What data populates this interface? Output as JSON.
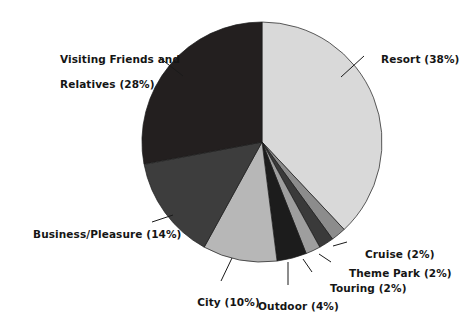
{
  "chart_data": {
    "type": "pie",
    "title": "",
    "subtitle": "",
    "xlabel": "",
    "ylabel": "",
    "legend_position": "none",
    "grid": false,
    "start_angle_deg": 0,
    "direction": "clockwise",
    "unit": "%",
    "categories": [
      "Resort",
      "Cruise",
      "Theme Park",
      "Touring",
      "Outdoor",
      "City",
      "Business/Pleasure",
      "Visiting Friends and Relatives"
    ],
    "values": [
      38,
      2,
      2,
      2,
      4,
      10,
      14,
      28
    ],
    "slices": [
      {
        "name": "Resort",
        "value": 38,
        "label": "Resort (38%)",
        "label_lines": [
          "Resort (38%)"
        ],
        "color": "#d9d9d9"
      },
      {
        "name": "Cruise",
        "value": 2,
        "label": "Cruise (2%)",
        "label_lines": [
          "Cruise (2%)"
        ],
        "color": "#8c8c8c"
      },
      {
        "name": "Theme Park",
        "value": 2,
        "label": "Theme Park (2%)",
        "label_lines": [
          "Theme Park (2%)"
        ],
        "color": "#3a3a3a"
      },
      {
        "name": "Touring",
        "value": 2,
        "label": "Touring (2%)",
        "label_lines": [
          "Touring (2%)"
        ],
        "color": "#9e9e9e"
      },
      {
        "name": "Outdoor",
        "value": 4,
        "label": "Outdoor (4%)",
        "label_lines": [
          "Outdoor (4%)"
        ],
        "color": "#1c1c1c"
      },
      {
        "name": "City",
        "value": 10,
        "label": "City (10%)",
        "label_lines": [
          "City (10%)"
        ],
        "color": "#b7b7b7"
      },
      {
        "name": "Business/Pleasure",
        "value": 14,
        "label": "Business/Pleasure (14%)",
        "label_lines": [
          "Business/Pleasure (14%)"
        ],
        "color": "#3d3d3d"
      },
      {
        "name": "Visiting Friends and Relatives",
        "value": 28,
        "label": "Visiting Friends and Relatives (28%)",
        "label_lines": [
          "Visiting Friends and",
          "Relatives (28%)"
        ],
        "color": "#231f1f"
      }
    ]
  },
  "labels": {
    "resort_line1": "Resort (38%)",
    "vfr_line1": "Visiting Friends and",
    "vfr_line2": "Relatives (28%)",
    "business_line1": "Business/Pleasure (14%)",
    "city_line1": "City (10%)",
    "outdoor_line1": "Outdoor (4%)",
    "touring_line1": "Touring (2%)",
    "themepark_line1": "Theme Park (2%)",
    "cruise_line1": "Cruise (2%)"
  },
  "colors": {
    "background": "#ffffff",
    "text": "#151515",
    "outline": "#1a1a1a",
    "resort": "#d9d9d9",
    "cruise": "#8c8c8c",
    "theme_park": "#3a3a3a",
    "touring": "#9e9e9e",
    "outdoor": "#1c1c1c",
    "city": "#b7b7b7",
    "business_pleasure": "#3d3d3d",
    "vfr": "#231f1f"
  }
}
